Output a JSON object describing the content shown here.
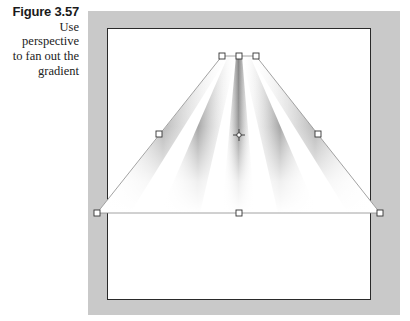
{
  "caption": {
    "figure_label": "Figure 3.57",
    "lines": [
      "Use perspective",
      "to fan out the",
      "gradient"
    ]
  },
  "artwork": {
    "frame_color": "#c9c9c9",
    "canvas_color": "#ffffff",
    "border_color": "#2a2a2a",
    "shape": "perspective-distorted linear gradient (fan of stripes)",
    "handles": {
      "top": [
        [
          222,
          56
        ],
        [
          239,
          56
        ],
        [
          256,
          56
        ]
      ],
      "middle": [
        [
          159,
          134
        ],
        [
          318,
          134
        ]
      ],
      "bottom": [
        [
          97,
          213
        ],
        [
          239,
          213
        ],
        [
          380,
          213
        ]
      ],
      "center_point": [
        239,
        135
      ]
    }
  }
}
